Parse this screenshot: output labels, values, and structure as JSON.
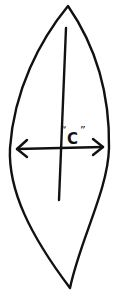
{
  "diagram": {
    "type": "leaf-outline-with-measurement",
    "label": "C",
    "label_open_quote": "“",
    "label_close_quote": "”",
    "stroke_color": "#111111",
    "background": "#ffffff",
    "shapes": {
      "outline": "leaf / lens shape with pointed top and bottom",
      "midrib": "vertical line through center",
      "measurement_arrow": "double-headed horizontal arrow across widest part"
    }
  }
}
